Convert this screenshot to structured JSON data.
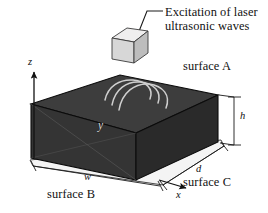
{
  "figure": {
    "background_color": "#ffffff",
    "ink_color": "#111111"
  },
  "callout": {
    "line1": "Excitation of laser",
    "line2": "ultrasonic waves",
    "leader_line": "leader-line"
  },
  "source": {
    "name": "laser-source-cube",
    "fill_color": "#d9d9d9",
    "top_color": "#eceaea",
    "side_color": "#b9b9b9",
    "edge_color": "#2a2a2a"
  },
  "specimen": {
    "name": "rectangular-block",
    "top_face_color": "#3b3b3b",
    "front_face_color": "#333333",
    "right_face_color": "#2b2b2b",
    "edge_color": "#0d0d0d",
    "base_color": "#f2f2f2"
  },
  "waves": {
    "name": "ultrasonic-wavefronts",
    "count": 3,
    "color": "#cfcfcf"
  },
  "surfaces": {
    "a": "surface A",
    "b": "surface B",
    "c": "surface C"
  },
  "axes": {
    "x": "x",
    "y": "y",
    "z": "z"
  },
  "dimensions": {
    "width": "w",
    "depth": "d",
    "height": "h"
  }
}
